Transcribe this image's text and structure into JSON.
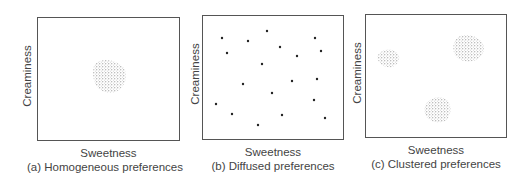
{
  "panels": [
    {
      "id": "a",
      "xlabel": "Sweetness",
      "ylabel": "Creaminess",
      "caption": "(a) Homogeneous preferences",
      "pattern": "single central cluster"
    },
    {
      "id": "b",
      "xlabel": "Sweetness",
      "ylabel": "Creaminess",
      "caption": "(b) Diffused preferences",
      "pattern": "scattered individual points"
    },
    {
      "id": "c",
      "xlabel": "Sweetness",
      "ylabel": "Creaminess",
      "caption": "(c) Clustered preferences",
      "pattern": "three distinct clusters"
    }
  ],
  "colors": {
    "border": "#555555",
    "stipple": "#7a7a7a",
    "dot": "#222222",
    "text": "#444444"
  }
}
